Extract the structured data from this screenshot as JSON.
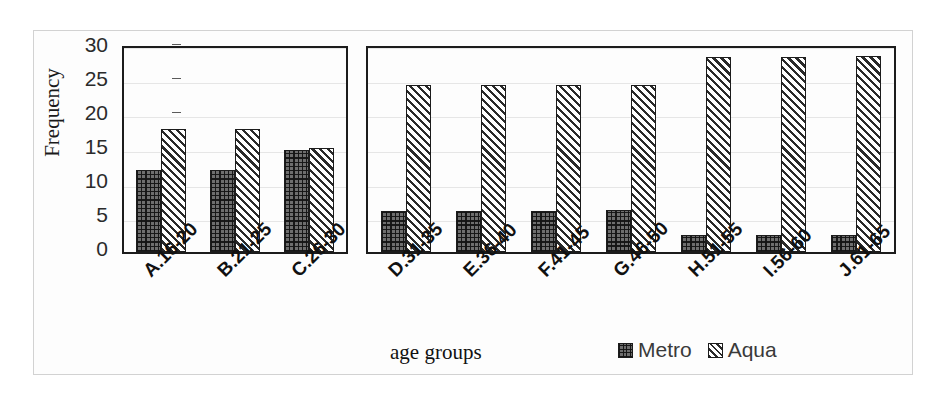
{
  "chart_data": {
    "type": "bar",
    "title": "",
    "xlabel": "age groups",
    "ylabel": "Frequency",
    "ylim": [
      0,
      30
    ],
    "ytick_values": [
      30,
      25,
      20,
      15,
      10,
      5,
      0
    ],
    "ytick_labels": [
      "30",
      "25",
      "20",
      "15",
      "10",
      "5",
      "0"
    ],
    "grid": true,
    "legend_position": "bottom-right",
    "categories": [
      "A.16-20",
      "B.21-25",
      "C.26-30",
      "D.31-35",
      "E.36-40",
      "F.41-45",
      "G.46-50",
      "H.51-55",
      "I.56-60",
      "J.61-65"
    ],
    "series": [
      {
        "name": "Metro",
        "pattern": "crosshatch",
        "values": [
          12,
          12,
          15,
          6,
          6,
          6,
          6.2,
          2.5,
          2.5,
          2.5
        ]
      },
      {
        "name": "Aqua",
        "pattern": "diagonal-hatch",
        "values": [
          18,
          18,
          15.2,
          24.4,
          24.4,
          24.4,
          24.5,
          28.5,
          28.5,
          28.7
        ]
      }
    ],
    "panels": [
      {
        "name": "panel-left",
        "categories": [
          "A.16-20",
          "B.21-25",
          "C.26-30"
        ]
      },
      {
        "name": "panel-right",
        "categories": [
          "D.31-35",
          "E.36-40",
          "F.41-45",
          "G.46-50",
          "H.51-55",
          "I.56-60",
          "J.61-65"
        ]
      }
    ]
  },
  "axis": {
    "y_title": "Frequency",
    "x_title": "age groups"
  },
  "legend": {
    "items": [
      {
        "label": "Metro"
      },
      {
        "label": "Aqua"
      }
    ]
  }
}
